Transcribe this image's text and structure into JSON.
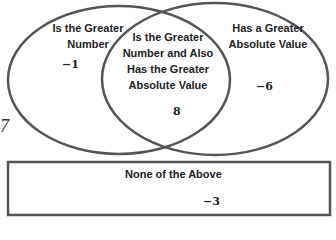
{
  "diagram": {
    "type": "venn",
    "sets": {
      "left": {
        "label": "Is the Greater Number",
        "label_lines": [
          "Is the Greater",
          "Number"
        ],
        "value": "−1"
      },
      "intersection": {
        "label": "Is the Greater Number and Also Has the Greater Absolute Value",
        "label_lines": [
          "Is the Greater",
          "Number and Also",
          "Has the Greater",
          "Absolute Value"
        ],
        "value": "8"
      },
      "right": {
        "label": "Has a Greater Absolute Value",
        "label_lines": [
          "Has a Greater",
          "Absolute Value"
        ],
        "value": "−6"
      }
    },
    "outside": {
      "label": "None of the Above",
      "value": "−3"
    },
    "stray_mark": "7",
    "colors": {
      "stroke": "#555555",
      "text": "#222222",
      "background": "#ffffff"
    }
  }
}
